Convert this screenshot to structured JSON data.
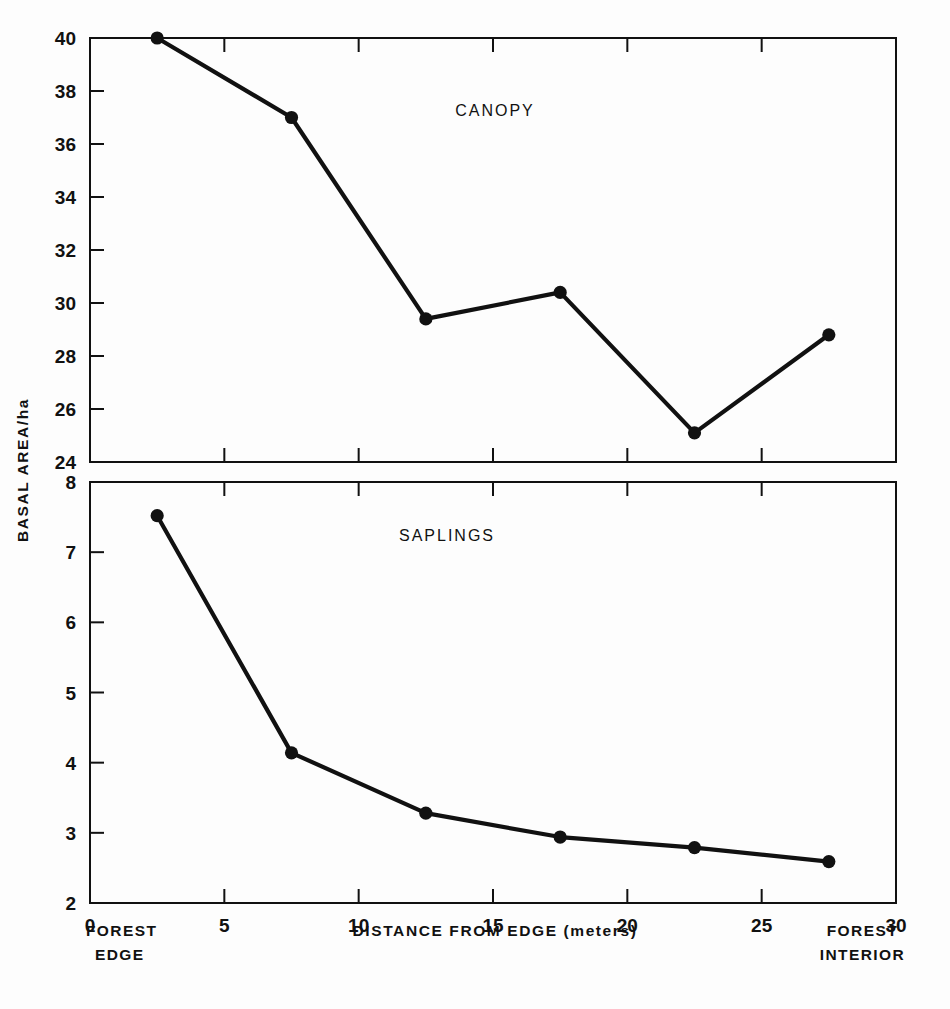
{
  "figure": {
    "background_color": "#fdfdfd",
    "ink_color": "#111111",
    "y_axis_title": "BASAL AREA/ha",
    "x_axis_title": "DISTANCE FROM EDGE (meters)",
    "left_corner_label_line1": "FOREST",
    "left_corner_label_line2": "EDGE",
    "right_corner_label_line1": "FOREST",
    "right_corner_label_line2": "INTERIOR",
    "x_tick_labels": [
      "0",
      "5",
      "10",
      "15",
      "20",
      "25",
      "30"
    ],
    "panel_top_title": "CANOPY",
    "panel_bottom_title": "SAPLINGS",
    "top_y_tick_labels": [
      "40",
      "38",
      "36",
      "34",
      "32",
      "30",
      "28",
      "26",
      "24"
    ],
    "bottom_y_tick_labels": [
      "8",
      "7",
      "6",
      "5",
      "4",
      "3",
      "2"
    ]
  },
  "chart_data": [
    {
      "type": "line",
      "title": "CANOPY",
      "xlabel": "DISTANCE FROM EDGE (meters)",
      "ylabel": "BASAL AREA/ha",
      "x": [
        2.5,
        7.5,
        12.5,
        17.5,
        22.5,
        27.5
      ],
      "values": [
        40.0,
        37.0,
        29.4,
        30.4,
        25.1,
        28.8
      ],
      "xlim": [
        0,
        30
      ],
      "ylim": [
        24,
        40
      ],
      "xticks": [
        0,
        5,
        10,
        15,
        20,
        25,
        30
      ],
      "yticks": [
        24,
        26,
        28,
        30,
        32,
        34,
        36,
        38,
        40
      ],
      "grid": false,
      "legend": "none",
      "marker": "filled-circle",
      "line_color": "#111111"
    },
    {
      "type": "line",
      "title": "SAPLINGS",
      "xlabel": "DISTANCE FROM EDGE (meters)",
      "ylabel": "BASAL AREA/ha",
      "x": [
        2.5,
        7.5,
        12.5,
        17.5,
        22.5,
        27.5
      ],
      "values": [
        7.52,
        4.14,
        3.28,
        2.94,
        2.79,
        2.59
      ],
      "xlim": [
        0,
        30
      ],
      "ylim": [
        2,
        8
      ],
      "xticks": [
        0,
        5,
        10,
        15,
        20,
        25,
        30
      ],
      "yticks": [
        2,
        3,
        4,
        5,
        6,
        7,
        8
      ],
      "grid": false,
      "legend": "none",
      "marker": "filled-circle",
      "line_color": "#111111"
    }
  ]
}
